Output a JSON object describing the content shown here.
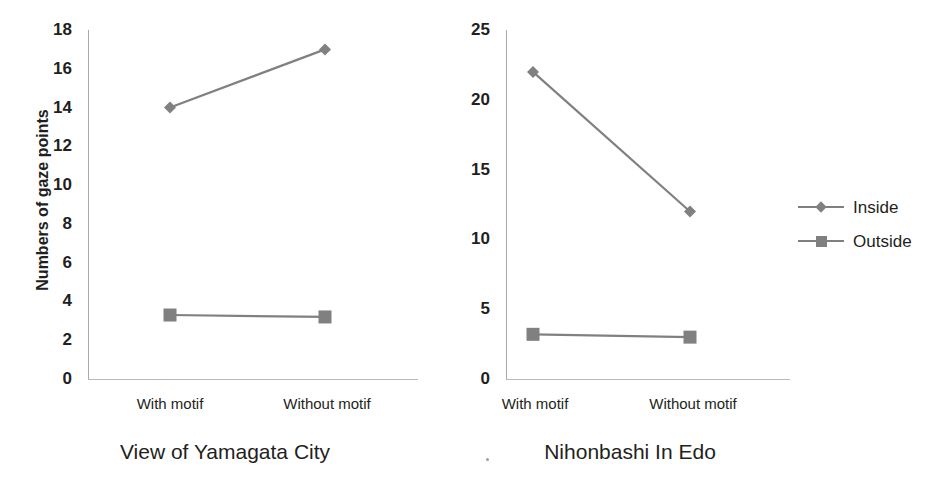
{
  "figure": {
    "background": "#ffffff",
    "series_color": "#808080",
    "text_color": "#231f20",
    "axis_color": "#a9a9a9"
  },
  "legend": {
    "position": "right",
    "items": [
      {
        "label": "Inside",
        "marker": "diamond",
        "color": "#808080"
      },
      {
        "label": "Outside",
        "marker": "square",
        "color": "#808080"
      }
    ]
  },
  "artifact": {
    "glyph": "."
  },
  "chart_data": [
    {
      "type": "line",
      "title": "View of Yamagata City",
      "xlabel": "",
      "ylabel": "Numbers of gaze points",
      "categories": [
        "With motif",
        "Without motif"
      ],
      "ylim": [
        0,
        18
      ],
      "yticks": [
        0,
        2,
        4,
        6,
        8,
        10,
        12,
        14,
        16,
        18
      ],
      "ytick_labels": [
        "0",
        "2",
        "4",
        "6",
        "8",
        "10",
        "12",
        "14",
        "16",
        "18"
      ],
      "grid": false,
      "legend_position": "right",
      "series": [
        {
          "name": "Inside",
          "marker": "diamond",
          "color": "#808080",
          "values": [
            14,
            17
          ]
        },
        {
          "name": "Outside",
          "marker": "square",
          "color": "#808080",
          "values": [
            3.3,
            3.2
          ]
        }
      ]
    },
    {
      "type": "line",
      "title": "Nihonbashi In Edo",
      "xlabel": "",
      "ylabel": "",
      "categories": [
        "With motif",
        "Without motif"
      ],
      "ylim": [
        0,
        25
      ],
      "yticks": [
        0,
        5,
        10,
        15,
        20,
        25
      ],
      "ytick_labels": [
        "0",
        "5",
        "10",
        "15",
        "20",
        "25"
      ],
      "grid": false,
      "legend_position": "right",
      "series": [
        {
          "name": "Inside",
          "marker": "diamond",
          "color": "#808080",
          "values": [
            22,
            12
          ]
        },
        {
          "name": "Outside",
          "marker": "square",
          "color": "#808080",
          "values": [
            3.2,
            3.0
          ]
        }
      ]
    }
  ]
}
